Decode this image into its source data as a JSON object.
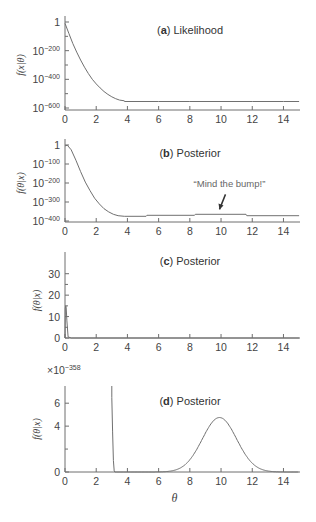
{
  "chart_data": [
    {
      "id": "a",
      "type": "line",
      "title_letter": "a",
      "title_text": "Likelihood",
      "ylabel": "f(x|θ)",
      "xlabel": "",
      "yscale": "log10",
      "xlim": [
        0,
        15
      ],
      "ylim_exponent": [
        -600,
        0
      ],
      "xticks": [
        0,
        2,
        4,
        6,
        8,
        10,
        12,
        14
      ],
      "yticks": [
        {
          "exp": 0,
          "label": "1"
        },
        {
          "exp": -200,
          "label": "10",
          "sup": "−200"
        },
        {
          "exp": -400,
          "label": "10",
          "sup": "−400"
        },
        {
          "exp": -600,
          "label": "10",
          "sup": "−600"
        }
      ],
      "yminor_exp": [
        -100,
        -300,
        -500
      ],
      "series": [
        {
          "name": "likelihood",
          "x": [
            0,
            0.25,
            0.5,
            0.75,
            1.0,
            1.25,
            1.5,
            1.75,
            2.0,
            2.25,
            2.5,
            2.75,
            3.0,
            3.25,
            3.5,
            3.8,
            3.81,
            6,
            8,
            10,
            12,
            14,
            15
          ],
          "log10y": [
            -10,
            -80,
            -150,
            -210,
            -265,
            -315,
            -360,
            -400,
            -432,
            -460,
            -485,
            -505,
            -522,
            -535,
            -545,
            -550,
            -555,
            -555,
            -555,
            -555,
            -555,
            -555,
            -555
          ]
        }
      ]
    },
    {
      "id": "b",
      "type": "line",
      "title_letter": "b",
      "title_text": "Posterior",
      "ylabel": "f(θ|x)",
      "xlabel": "",
      "yscale": "log10",
      "xlim": [
        0,
        15
      ],
      "ylim_exponent": [
        -400,
        0
      ],
      "xticks": [
        0,
        2,
        4,
        6,
        8,
        10,
        12,
        14
      ],
      "yticks": [
        {
          "exp": 0,
          "label": "1"
        },
        {
          "exp": -100,
          "label": "10",
          "sup": "−100"
        },
        {
          "exp": -200,
          "label": "10",
          "sup": "−200"
        },
        {
          "exp": -300,
          "label": "10",
          "sup": "−300"
        },
        {
          "exp": -400,
          "label": "10",
          "sup": "−400"
        }
      ],
      "annotation": {
        "text": "“Mind the bump!”",
        "arrow_target_x": 9.9,
        "arrow_target_log10y": -360
      },
      "series": [
        {
          "name": "posterior",
          "x": [
            0,
            0.15,
            0.4,
            0.7,
            1.0,
            1.3,
            1.6,
            1.9,
            2.2,
            2.5,
            2.8,
            3.1,
            3.4,
            3.8,
            5.2,
            5.25,
            8.3,
            8.35,
            11.6,
            11.65,
            15
          ],
          "log10y": [
            -5,
            -1,
            -25,
            -80,
            -140,
            -195,
            -240,
            -280,
            -310,
            -335,
            -352,
            -365,
            -372,
            -375,
            -375,
            -370,
            -370,
            -365,
            -365,
            -372,
            -372
          ]
        }
      ]
    },
    {
      "id": "c",
      "type": "line",
      "title_letter": "c",
      "title_text": "Posterior",
      "ylabel": "f(θ|x)",
      "xlabel": "",
      "yscale": "linear",
      "xlim": [
        0,
        15
      ],
      "ylim": [
        0,
        35
      ],
      "xticks": [
        0,
        2,
        4,
        6,
        8,
        10,
        12,
        14
      ],
      "yticks": [
        0,
        10,
        20,
        30
      ],
      "yminor": [
        5,
        15,
        25
      ],
      "series": [
        {
          "name": "posterior",
          "x": [
            0,
            0.02,
            0.05,
            0.08,
            0.12,
            0.2,
            0.4,
            15
          ],
          "y": [
            0,
            14,
            15,
            14,
            8,
            0.5,
            0,
            0
          ]
        }
      ]
    },
    {
      "id": "d",
      "type": "line",
      "title_letter": "d",
      "title_text": "Posterior",
      "ylabel": "f(θ|x)",
      "xlabel": "θ",
      "yscale": "linear",
      "y_multiplier_label": "×10",
      "y_multiplier_sup": "−358",
      "xlim": [
        0,
        15
      ],
      "ylim": [
        0,
        7.5
      ],
      "xticks": [
        0,
        2,
        4,
        6,
        8,
        10,
        12,
        14
      ],
      "yticks": [
        0,
        4,
        6
      ],
      "yminor": [
        2
      ],
      "series": [
        {
          "name": "spike",
          "x": [
            3.0,
            3.0,
            3.05,
            3.1,
            3.15,
            3.2
          ],
          "y": [
            7.5,
            6.5,
            3.5,
            1.0,
            0.1,
            0
          ]
        },
        {
          "name": "bump",
          "gaussian": {
            "mean": 9.9,
            "sd": 1.1,
            "peak": 4.75,
            "x_range": [
              3.2,
              15
            ]
          }
        }
      ]
    }
  ]
}
